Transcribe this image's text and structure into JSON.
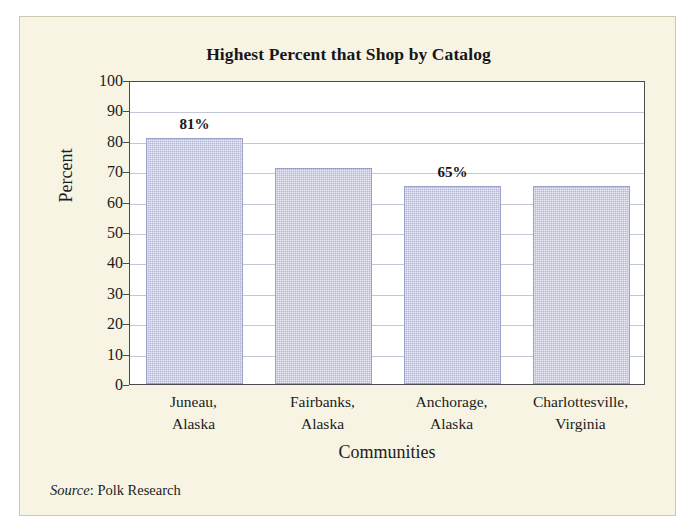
{
  "figure": {
    "panel_background": "#f7f4e4",
    "title": "Highest Percent that Shop by Catalog",
    "source_word": "Source",
    "source_text": ": Polk Research"
  },
  "chart_data": {
    "type": "bar",
    "title": "Highest Percent that Shop by Catalog",
    "xlabel": "Communities",
    "ylabel": "Percent",
    "categories": [
      "Juneau,\nAlaska",
      "Fairbanks,\nAlaska",
      "Anchorage,\nAlaska",
      "Charlottesville,\nVirginia"
    ],
    "category_lines": [
      [
        "Juneau,",
        "Alaska"
      ],
      [
        "Fairbanks,",
        "Alaska"
      ],
      [
        "Anchorage,",
        "Alaska"
      ],
      [
        "Charlottesville,",
        "Virginia"
      ]
    ],
    "values": [
      81,
      71,
      65,
      65
    ],
    "data_labels": [
      "81%",
      "",
      "65%",
      ""
    ],
    "ylim": [
      0,
      100
    ],
    "ytick_step": 10,
    "yticks": [
      100,
      90,
      80,
      70,
      60,
      50,
      40,
      30,
      20,
      10,
      0
    ],
    "ytick_labels": [
      "100",
      "90",
      "80",
      "70",
      "60",
      "50",
      "40",
      "30",
      "20",
      "10",
      "0"
    ],
    "grid": true,
    "legend": "none",
    "bar_color": "#b2b7da",
    "bar_edge_color": "#9aa0c8",
    "plot_background": "#ffffff",
    "axis_color": "#4a4a52",
    "gridline_color": "#c3c7d6"
  }
}
